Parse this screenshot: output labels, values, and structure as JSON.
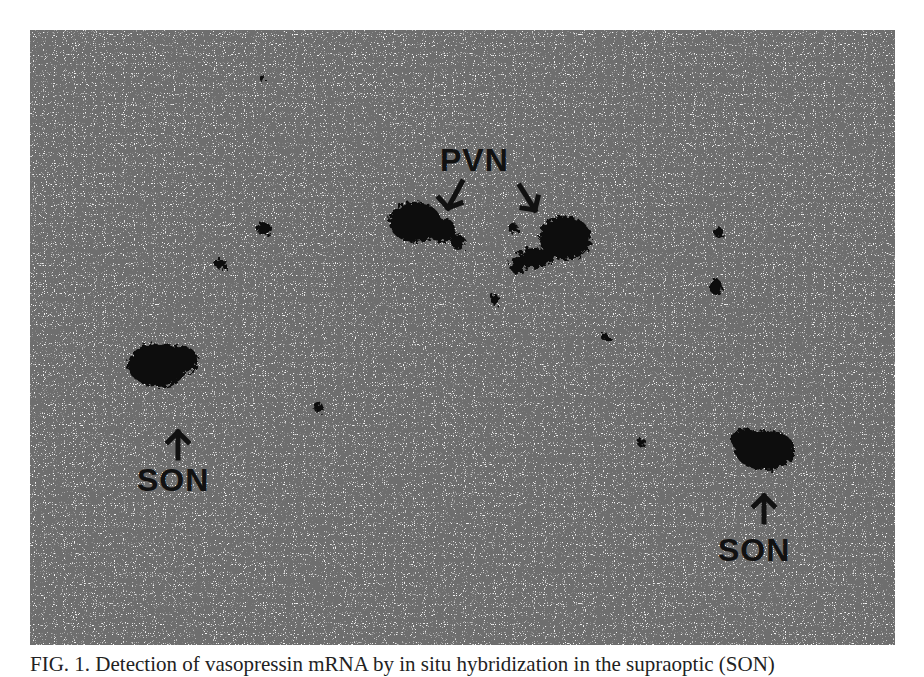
{
  "figure": {
    "labels": {
      "pvn": "PVN",
      "son_left": "SON",
      "son_right": "SON"
    },
    "caption": "FIG. 1. Detection of vasopressin mRNA by in situ hybridization in the supraoptic (SON)"
  }
}
